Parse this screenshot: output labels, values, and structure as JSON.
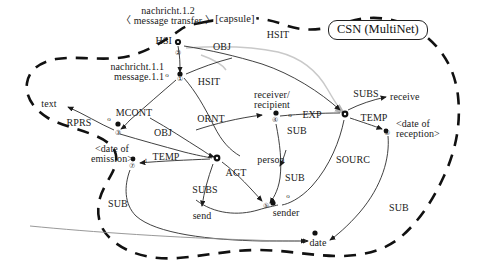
{
  "diagram": {
    "title": "CSN (MultiNet)",
    "capsule_label": "[capsule]",
    "notation": "MultiNet semantic network (CSN) for a message transfer"
  },
  "concepts": [
    {
      "id": "nachricht12",
      "label_line1": "nachricht.1.2",
      "label_line2": "〈 message transfer 〉",
      "x": 168,
      "y": 11
    },
    {
      "id": "hsi",
      "label": "HSI",
      "x": 160,
      "y": 42
    },
    {
      "id": "nachricht11",
      "label_line1": "nachricht.1.1",
      "label_line2": "message.1.1",
      "x": 95,
      "y": 72
    },
    {
      "id": "text",
      "label": "text",
      "x": 49,
      "y": 104
    },
    {
      "id": "receiver",
      "label_line1": "receiver/",
      "label_line2": "recipient",
      "x": 265,
      "y": 98
    },
    {
      "id": "receive",
      "label": "receive",
      "x": 403,
      "y": 97
    },
    {
      "id": "date_reception",
      "label_line1": "<date of",
      "label_line2": "reception>",
      "x": 416,
      "y": 126
    },
    {
      "id": "date_emission",
      "label_line1": "<date of",
      "label_line2": "emission>",
      "x": 110,
      "y": 150
    },
    {
      "id": "person",
      "label": "person",
      "x": 271,
      "y": 160
    },
    {
      "id": "sender",
      "label": "sender",
      "x": 283,
      "y": 214
    },
    {
      "id": "send",
      "label": "send",
      "x": 201,
      "y": 216
    },
    {
      "id": "date",
      "label": "date",
      "x": 318,
      "y": 240
    }
  ],
  "relations": [
    {
      "id": "obj1",
      "label": "OBJ",
      "x": 222,
      "y": 47
    },
    {
      "id": "hsit_top",
      "label": "HSIT",
      "x": 276,
      "y": 35
    },
    {
      "id": "hsit_mid",
      "label": "HSIT",
      "x": 206,
      "y": 82
    },
    {
      "id": "mcont",
      "label": "MCONT",
      "x": 131,
      "y": 113
    },
    {
      "id": "rprs",
      "label": "RPRS",
      "x": 79,
      "y": 122
    },
    {
      "id": "obj2",
      "label": "OBJ",
      "x": 162,
      "y": 132
    },
    {
      "id": "ornt",
      "label": "ORNT",
      "x": 209,
      "y": 119
    },
    {
      "id": "exp",
      "label": "EXP",
      "x": 310,
      "y": 116
    },
    {
      "id": "subs_top",
      "label": "SUBS",
      "x": 366,
      "y": 94
    },
    {
      "id": "temp_right",
      "label": "TEMP",
      "x": 372,
      "y": 118
    },
    {
      "id": "temp_left",
      "label": "TEMP",
      "x": 164,
      "y": 157
    },
    {
      "id": "sub_exp",
      "label": "SUB",
      "x": 295,
      "y": 131
    },
    {
      "id": "agt",
      "label": "AGT",
      "x": 234,
      "y": 173
    },
    {
      "id": "sub_person",
      "label": "SUB",
      "x": 294,
      "y": 178
    },
    {
      "id": "sourc",
      "label": "SOURC",
      "x": 351,
      "y": 160
    },
    {
      "id": "subs_send",
      "label": "SUBS",
      "x": 203,
      "y": 190
    },
    {
      "id": "sub_emission",
      "label": "SUB",
      "x": 117,
      "y": 204
    },
    {
      "id": "sub_date",
      "label": "SUB",
      "x": 397,
      "y": 208
    }
  ],
  "nodes": [
    {
      "id": "n1",
      "number": "①",
      "x": 180,
      "y": 76,
      "marker": "o",
      "marker_x": 166,
      "marker_y": 76
    },
    {
      "id": "n2",
      "number": "②",
      "x": 178,
      "y": 50,
      "marker": "",
      "marker_x": 0,
      "marker_y": 0
    },
    {
      "id": "n3",
      "number": "③",
      "x": 118,
      "y": 131,
      "marker": "o",
      "marker_x": 108,
      "marker_y": 119
    },
    {
      "id": "n4",
      "number": "④",
      "x": 274,
      "y": 117,
      "marker": "o",
      "marker_x": 290,
      "marker_y": 114
    },
    {
      "id": "n5",
      "number": "⑤",
      "x": 266,
      "y": 205,
      "marker": "o",
      "marker_x": 288,
      "marker_y": 197
    },
    {
      "id": "n6",
      "number": "⑥",
      "x": 387,
      "y": 130,
      "marker": "",
      "marker_x": 0,
      "marker_y": 0
    },
    {
      "id": "n7",
      "number": "⑦",
      "x": 131,
      "y": 165,
      "marker": "t",
      "marker_x": 145,
      "marker_y": 160
    }
  ],
  "colors": {
    "ink": "#1a1a1a",
    "edge": "#2b2b2b",
    "boundary": "#111111",
    "gray_edge": "#c9c9c9",
    "background": "#ffffff"
  }
}
